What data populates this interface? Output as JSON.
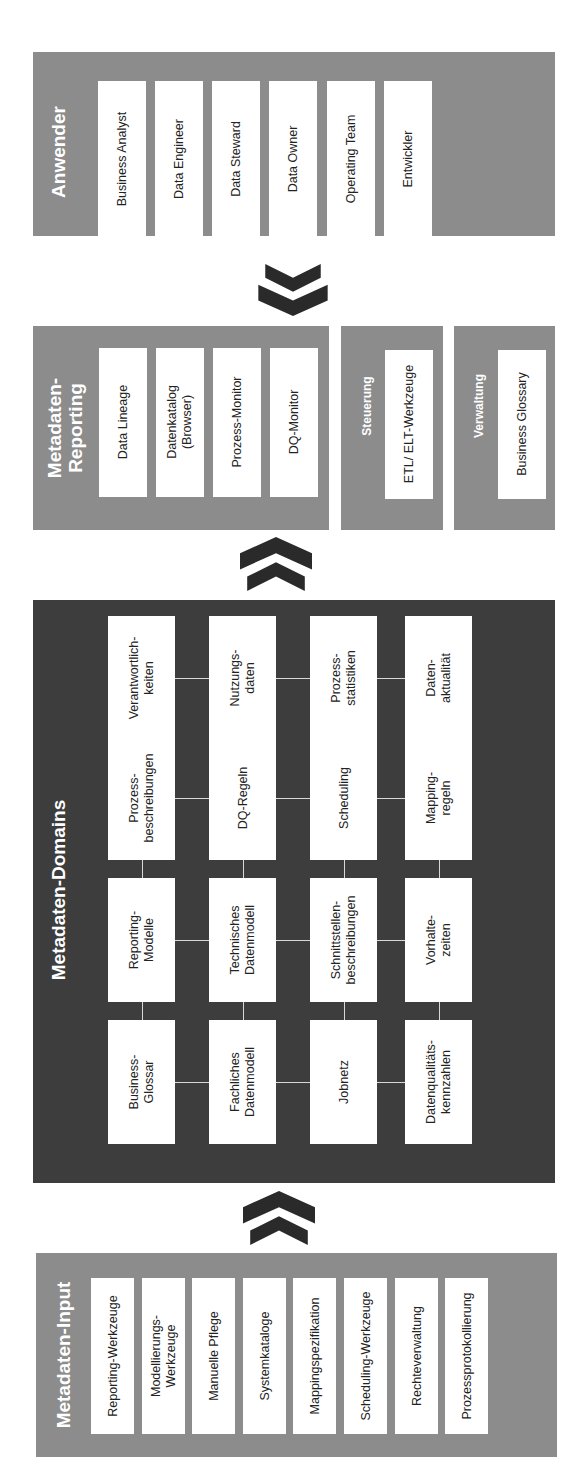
{
  "diagram": {
    "anwender": {
      "title": "Anwender",
      "items": [
        "Business Analyst",
        "Data Engineer",
        "Data Steward",
        "Data Owner",
        "Operating Team",
        "Entwickler"
      ]
    },
    "reporting": {
      "title_line1": "Metadaten-",
      "title_line2": "Reporting",
      "items": [
        "Data Lineage",
        "Datenkatalog (Browser)",
        "Prozess-Monitor",
        "DQ-Monitor"
      ],
      "items_lines": [
        [
          "Data Lineage"
        ],
        [
          "Datenkatalog",
          "(Browser)"
        ],
        [
          "Prozess-Monitor"
        ],
        [
          "DQ-Monitor"
        ]
      ]
    },
    "steuerung": {
      "title": "Steuerung",
      "items": [
        "ETL/ ELT-Werkzeuge"
      ]
    },
    "verwaltung": {
      "title": "Verwaltung",
      "items": [
        "Business Glossary"
      ]
    },
    "domains": {
      "title": "Metadaten-Domains",
      "rows": [
        [
          [
            "Business-",
            "Glossar"
          ],
          [
            "Reporting-",
            "Modelle"
          ],
          [
            "Prozess-",
            "beschreibungen"
          ],
          [
            "Verantwortlich-",
            "keiten"
          ]
        ],
        [
          [
            "Fachliches",
            "Datenmodell"
          ],
          [
            "Technisches",
            "Datenmodell"
          ],
          [
            "DQ-Regeln"
          ],
          [
            "Nutzungs-",
            "daten"
          ]
        ],
        [
          [
            "Jobnetz"
          ],
          [
            "Schnittstellen-",
            "beschreibungen"
          ],
          [
            "Scheduling"
          ],
          [
            "Prozess-",
            "statistiken"
          ]
        ],
        [
          [
            "Datenqualitäts-",
            "kennzahlen"
          ],
          [
            "Vorhalte-",
            "zeiten"
          ],
          [
            "Mapping-",
            "regeln"
          ],
          [
            "Daten-",
            "aktualität"
          ]
        ]
      ]
    },
    "input": {
      "title": "Metadaten-Input",
      "items": [
        [
          "Reporting-Werkzeuge"
        ],
        [
          "Modellierungs-",
          "Werkzeuge"
        ],
        [
          "Manuelle Pflege"
        ],
        [
          "Systemkataloge"
        ],
        [
          "Mappingspezifikation"
        ],
        [
          "Scheduling-Werkzeuge"
        ],
        [
          "Rechteverwaltung"
        ],
        [
          "Prozessprotokollierung"
        ]
      ]
    },
    "arrows": [
      {
        "name": "users-to-reporting",
        "direction": "down"
      },
      {
        "name": "domains-to-reporting",
        "direction": "up"
      },
      {
        "name": "input-to-domains",
        "direction": "up"
      }
    ],
    "colors": {
      "light_panel": "#8c8c8c",
      "dark_panel": "#3d3d3d",
      "box": "#ffffff",
      "arrow": "#2a2a2a"
    }
  }
}
